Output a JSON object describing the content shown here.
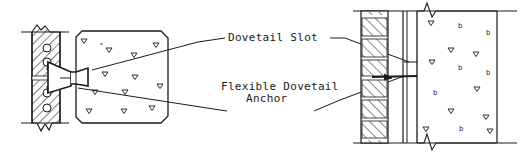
{
  "diagram": {
    "type": "construction-detail",
    "labels": {
      "dovetail_slot": "Dovetail Slot",
      "flexible_anchor_line1": "Flexible Dovetail",
      "flexible_anchor_line2": "Anchor"
    },
    "views": [
      {
        "name": "plan-section",
        "elements": [
          "masonry wythe (hatched brick with cores)",
          "concrete column",
          "dovetail slot",
          "flexible dovetail anchor"
        ]
      },
      {
        "name": "elevation-section",
        "elements": [
          "brick veneer",
          "air space",
          "dovetail slot",
          "concrete wall"
        ]
      }
    ],
    "colors": {
      "ink": "#1a1a1a",
      "background": "#ffffff"
    }
  }
}
